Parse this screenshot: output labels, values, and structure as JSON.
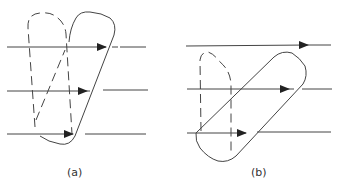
{
  "figure": {
    "panels": [
      {
        "id": "a",
        "label": "(a)",
        "description": "Flux lines passing a dashed loop and a tilted solid loop that overlap"
      },
      {
        "id": "b",
        "label": "(b)",
        "description": "Flux lines passing a dashed loop and a solid loop rotated further"
      }
    ],
    "colors": {
      "stroke": "#333333",
      "background": "#ffffff"
    }
  }
}
